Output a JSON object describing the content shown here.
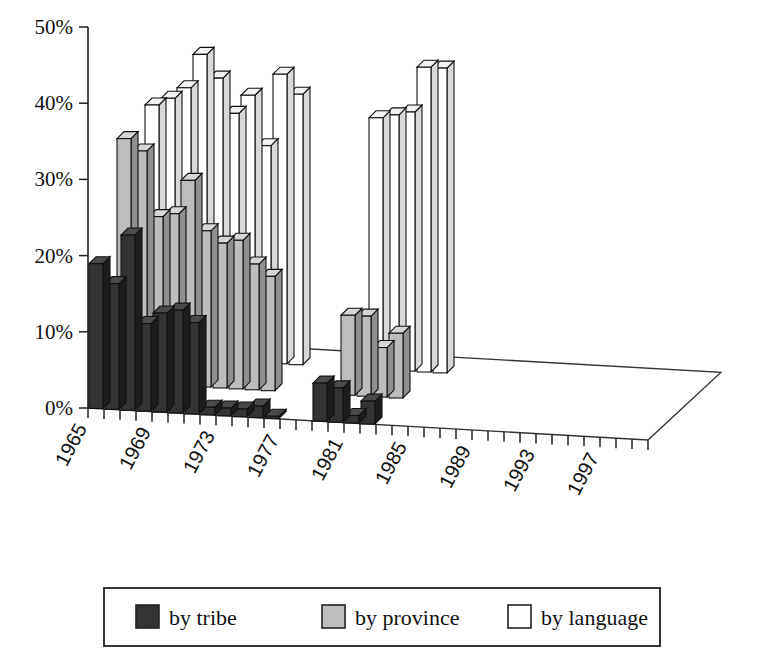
{
  "chart_data": {
    "type": "bar",
    "title": "",
    "subtitle": "",
    "xlabel": "",
    "ylabel": "",
    "ylim": [
      0,
      50
    ],
    "yticks": [
      0,
      10,
      20,
      30,
      40,
      50
    ],
    "ytick_labels": [
      "0%",
      "10%",
      "20%",
      "30%",
      "40%",
      "50%"
    ],
    "grid": false,
    "projection": "3d",
    "legend_position": "bottom",
    "categories": [
      "1965",
      "1966",
      "1967",
      "1968",
      "1969",
      "1970",
      "1971",
      "1972",
      "1973",
      "1974",
      "1975",
      "1976",
      "1977",
      "1978",
      "1979",
      "1980",
      "1981",
      "1982",
      "1983",
      "1984",
      "1985",
      "1986",
      "1987",
      "1988",
      "1989",
      "1990",
      "1991",
      "1992",
      "1993",
      "1994",
      "1995",
      "1996",
      "1997",
      "1998",
      "1999"
    ],
    "xtick_labels": [
      "1965",
      "",
      "",
      "",
      "1969",
      "",
      "",
      "",
      "1973",
      "",
      "",
      "",
      "1977",
      "",
      "",
      "",
      "1981",
      "",
      "",
      "",
      "1985",
      "",
      "",
      "",
      "1989",
      "",
      "",
      "",
      "1993",
      "",
      "",
      "",
      "1997",
      "",
      ""
    ],
    "series": [
      {
        "name": "by tribe",
        "color": "#333333",
        "values": [
          19.0,
          16.5,
          23.0,
          11.5,
          13.0,
          13.5,
          12.0,
          1.0,
          1.0,
          1.0,
          1.5,
          0.3,
          null,
          null,
          5.0,
          4.5,
          1.0,
          3.0,
          null,
          null,
          null,
          null,
          null,
          null,
          null,
          null,
          null,
          null,
          null,
          null,
          null,
          null,
          null,
          null,
          null
        ]
      },
      {
        "name": "by province",
        "color": "#bdbdbd",
        "values": [
          32.0,
          30.5,
          22.0,
          22.5,
          27.0,
          20.5,
          19.0,
          19.5,
          16.5,
          15.0,
          null,
          null,
          null,
          null,
          10.5,
          10.5,
          6.5,
          8.5,
          null,
          null,
          null,
          null,
          null,
          null,
          null,
          null,
          null,
          null,
          null,
          null,
          null,
          null,
          null,
          null,
          null
        ]
      },
      {
        "name": "by language",
        "color": "#ffffff",
        "values": [
          33.0,
          34.0,
          35.5,
          40.0,
          37.0,
          32.5,
          35.0,
          28.5,
          38.0,
          35.5,
          null,
          null,
          null,
          null,
          33.0,
          33.5,
          34.0,
          40.0,
          40.0,
          null,
          null,
          null,
          null,
          null,
          null,
          null,
          null,
          null,
          null,
          null,
          null,
          null,
          null,
          null,
          null
        ]
      }
    ],
    "series_order": [
      "by tribe",
      "by province",
      "by language"
    ]
  },
  "legend": {
    "items": [
      {
        "label": "by tribe",
        "swatch": "dark-swatch",
        "color": "#333333"
      },
      {
        "label": "by province",
        "swatch": "gray-swatch",
        "color": "#bdbdbd"
      },
      {
        "label": "by language",
        "swatch": "white-swatch",
        "color": "#ffffff"
      }
    ]
  },
  "axes": {
    "y_ticks": [
      "50%",
      "40%",
      "30%",
      "20%",
      "10%",
      "0%"
    ],
    "x_labels": [
      "1965",
      "1969",
      "1973",
      "1977",
      "1981",
      "1985",
      "1989",
      "1993",
      "1997"
    ]
  }
}
